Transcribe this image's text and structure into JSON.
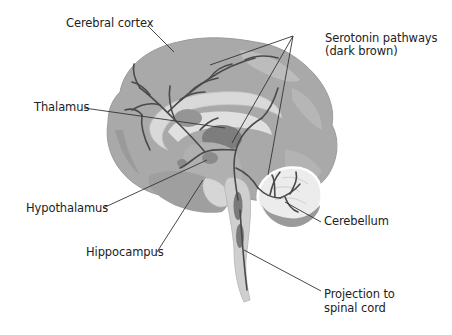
{
  "labels": {
    "cerebral_cortex": "Cerebral cortex",
    "serotonin_line1": "Serotonin pathways",
    "serotonin_line2": "(dark brown)",
    "thalamus": "Thalamus",
    "hypothalamus": "Hypothalamus",
    "hippocampus": "Hippocampus",
    "cerebellum": "Cerebellum",
    "projection_line1": "Projection to",
    "projection_line2": "spinal cord"
  },
  "colors": {
    "cortex": "#a9a9a9",
    "cortex_dark": "#8e8e8e",
    "inner_light": "#d6d6d6",
    "inner_mid": "#bdbdbd",
    "structure_dark": "#7a7a7a",
    "pathway": "#4a4a4a",
    "leader": "#333333",
    "cerebellum_light": "#e8e8e8"
  }
}
